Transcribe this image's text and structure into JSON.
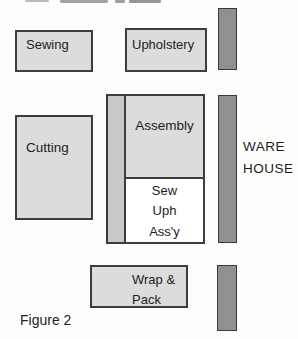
{
  "figure": {
    "caption": "Figure 2"
  },
  "rooms": {
    "sewing": {
      "label": "Sewing"
    },
    "upholstery": {
      "label": "Upholstery"
    },
    "cutting": {
      "label": "Cutting"
    },
    "assembly": {
      "label": "Assembly"
    },
    "finishing": {
      "lines": [
        "Sew",
        "Uph",
        "Ass'y"
      ]
    },
    "wrap_pack": {
      "lines": [
        "Wrap &",
        "Pack"
      ]
    },
    "warehouse": {
      "lines": [
        "WARE",
        "HOUSE"
      ]
    }
  },
  "colors": {
    "room_fill": "#dcdcdc",
    "corridor_fill": "#c8c8c8",
    "dock_fill": "#909090",
    "border": "#3d3d3d",
    "text": "#1c1c1c",
    "background": "#fdfdfc"
  }
}
